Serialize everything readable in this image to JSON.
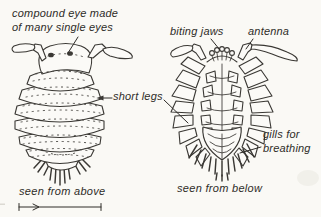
{
  "canvas": {
    "background": "#faf9f5",
    "paper": "#fbfaf7",
    "ink": "#3a3834",
    "text_color": "#2e2c28"
  },
  "labels": {
    "compound_eye": "compound eye made\nof many single eyes",
    "biting_jaws": "biting jaws",
    "antenna": "antenna",
    "short_legs": "short legs",
    "gills": "gills for\nbreathing"
  },
  "captions": {
    "left_figure": "seen from above",
    "right_figure": "seen from below"
  }
}
